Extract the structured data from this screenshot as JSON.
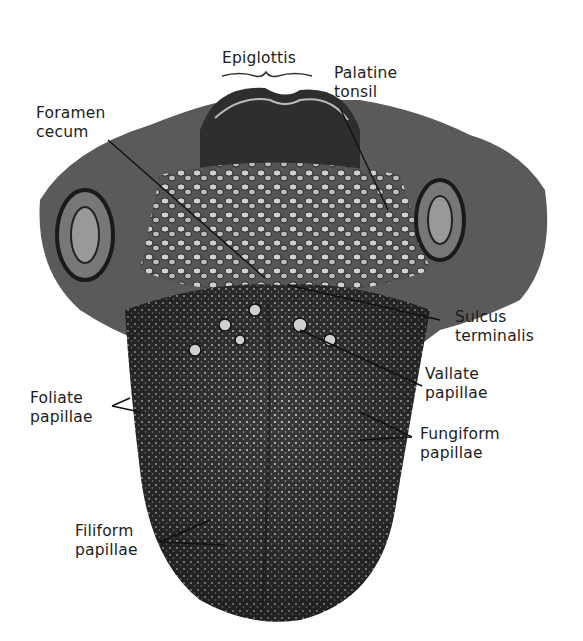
{
  "figure": {
    "background": "#ffffff",
    "ink": "#1c1c1c"
  },
  "labels": {
    "epiglottis": {
      "lines": [
        "Epiglottis"
      ]
    },
    "palatine_tonsil": {
      "lines": [
        "Palatine",
        "tonsil"
      ]
    },
    "foramen_cecum": {
      "lines": [
        "Foramen",
        "cecum"
      ]
    },
    "sulcus_terminalis": {
      "lines": [
        "Sulcus",
        "terminalis"
      ]
    },
    "vallate_papillae": {
      "lines": [
        "Vallate",
        "papillae"
      ]
    },
    "foliate_papillae": {
      "lines": [
        "Foliate",
        "papillae"
      ]
    },
    "fungiform_papillae": {
      "lines": [
        "Fungiform",
        "papillae"
      ]
    },
    "filiform_papillae": {
      "lines": [
        "Filiform",
        "papillae"
      ]
    }
  }
}
